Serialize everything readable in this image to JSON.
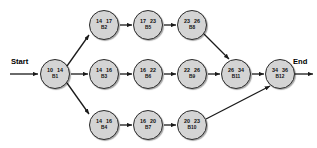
{
  "diagram": {
    "start_label": "Start",
    "end_label": "End",
    "node_fill": "#d4d4d4",
    "node_stroke": "#2b2b2b",
    "arrow_color": "#1a1a1a",
    "nodes": [
      {
        "id": "B1",
        "early": "10",
        "late": "14",
        "cx": 55,
        "cy": 74
      },
      {
        "id": "B2",
        "early": "14",
        "late": "17",
        "cx": 104,
        "cy": 25
      },
      {
        "id": "B5",
        "early": "17",
        "late": "23",
        "cx": 148,
        "cy": 25
      },
      {
        "id": "B8",
        "early": "23",
        "late": "26",
        "cx": 192,
        "cy": 25
      },
      {
        "id": "B3",
        "early": "14",
        "late": "16",
        "cx": 104,
        "cy": 74
      },
      {
        "id": "B6",
        "early": "16",
        "late": "22",
        "cx": 148,
        "cy": 74
      },
      {
        "id": "B9",
        "early": "22",
        "late": "26",
        "cx": 192,
        "cy": 74
      },
      {
        "id": "B11",
        "early": "26",
        "late": "34",
        "cx": 236,
        "cy": 74
      },
      {
        "id": "B12",
        "early": "34",
        "late": "36",
        "cx": 280,
        "cy": 74
      },
      {
        "id": "B4",
        "early": "14",
        "late": "16",
        "cx": 104,
        "cy": 125
      },
      {
        "id": "B7",
        "early": "16",
        "late": "20",
        "cx": 148,
        "cy": 125
      },
      {
        "id": "B10",
        "early": "20",
        "late": "23",
        "cx": 192,
        "cy": 125
      }
    ],
    "edges": [
      {
        "from": "Start",
        "to": "B1",
        "x1": 10,
        "y1": 74,
        "x2": 38,
        "y2": 74
      },
      {
        "from": "B1",
        "to": "B2",
        "x1": 67,
        "y1": 66,
        "x2": 89,
        "y2": 35
      },
      {
        "from": "B1",
        "to": "B3",
        "x1": 71,
        "y1": 74,
        "x2": 88,
        "y2": 74
      },
      {
        "from": "B1",
        "to": "B4",
        "x1": 67,
        "y1": 83,
        "x2": 89,
        "y2": 114
      },
      {
        "from": "B2",
        "to": "B5",
        "x1": 120,
        "y1": 25,
        "x2": 132,
        "y2": 25
      },
      {
        "from": "B5",
        "to": "B8",
        "x1": 164,
        "y1": 25,
        "x2": 176,
        "y2": 25
      },
      {
        "from": "B8",
        "to": "B11",
        "x1": 204,
        "y1": 34,
        "x2": 229,
        "y2": 59
      },
      {
        "from": "B3",
        "to": "B6",
        "x1": 120,
        "y1": 74,
        "x2": 132,
        "y2": 74
      },
      {
        "from": "B6",
        "to": "B9",
        "x1": 164,
        "y1": 74,
        "x2": 176,
        "y2": 74
      },
      {
        "from": "B9",
        "to": "B11",
        "x1": 208,
        "y1": 74,
        "x2": 220,
        "y2": 74
      },
      {
        "from": "B11",
        "to": "B12",
        "x1": 252,
        "y1": 74,
        "x2": 264,
        "y2": 74
      },
      {
        "from": "B4",
        "to": "B7",
        "x1": 120,
        "y1": 125,
        "x2": 132,
        "y2": 125
      },
      {
        "from": "B7",
        "to": "B10",
        "x1": 164,
        "y1": 125,
        "x2": 176,
        "y2": 125
      },
      {
        "from": "B10",
        "to": "B12",
        "x1": 206,
        "y1": 119,
        "x2": 270,
        "y2": 86
      },
      {
        "from": "B12",
        "to": "End",
        "x1": 295,
        "y1": 74,
        "x2": 313,
        "y2": 74
      }
    ]
  }
}
